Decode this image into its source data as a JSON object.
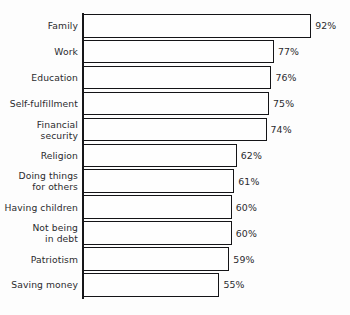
{
  "chart_data": {
    "type": "bar",
    "orientation": "horizontal",
    "title": "",
    "subtitle": "",
    "xlabel": "",
    "ylabel": "",
    "xlim": [
      0,
      100
    ],
    "grid": false,
    "legend": null,
    "value_suffix": "%",
    "categories": [
      "Family",
      "Work",
      "Education",
      "Self-fulfillment",
      "Financial security",
      "Religion",
      "Doing things for others",
      "Having children",
      "Not being in debt",
      "Patriotism",
      "Saving money"
    ],
    "values": [
      92,
      77,
      76,
      75,
      74,
      62,
      61,
      60,
      60,
      59,
      55
    ],
    "value_labels": [
      "92%",
      "77%",
      "76%",
      "75%",
      "74%",
      "62%",
      "61%",
      "60%",
      "60%",
      "59%",
      "55%"
    ],
    "category_label_lines": [
      [
        "Family"
      ],
      [
        "Work"
      ],
      [
        "Education"
      ],
      [
        "Self-fulfillment"
      ],
      [
        "Financial",
        "security"
      ],
      [
        "Religion"
      ],
      [
        "Doing things",
        "for others"
      ],
      [
        "Having children"
      ],
      [
        "Not being",
        "in debt"
      ],
      [
        "Patriotism"
      ],
      [
        "Saving money"
      ]
    ],
    "colors": {
      "background": "#fdfdfd",
      "bar_fill": "#fefefe",
      "bar_outline": "#141417",
      "axis": "#17171a",
      "text": "#2b2b2e"
    }
  }
}
